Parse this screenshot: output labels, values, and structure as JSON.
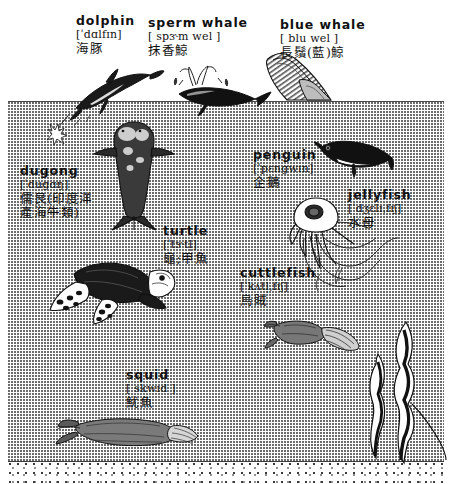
{
  "page": {
    "background_color": "#ffffff",
    "ink_color": "#111111",
    "water_fill": "stippled-halftone",
    "seabed": "speckled-sand-strip"
  },
  "scene": {
    "waterline_label": "water-surface-line",
    "regions": [
      {
        "name": "sky-above-water"
      },
      {
        "name": "underwater-body"
      },
      {
        "name": "sea-floor"
      }
    ]
  },
  "entries": [
    {
      "id": "dolphin",
      "word": "dolphin",
      "ipa": "[ˈdɑlfɪn]",
      "chinese": "海豚",
      "chinese2": "",
      "figure": "dolphin-leaping-figure"
    },
    {
      "id": "sperm-whale",
      "word": "sperm whale",
      "ipa": "[ spɝm wel ]",
      "chinese": "抹香鯨",
      "chinese2": "",
      "figure": "sperm-whale-figure"
    },
    {
      "id": "blue-whale",
      "word": "blue whale",
      "ipa": "[ blu wel ]",
      "chinese": "長鬚(藍)鯨",
      "chinese2": "",
      "figure": "blue-whale-figure"
    },
    {
      "id": "dugong",
      "word": "dugong",
      "ipa": "[ˈdugɑŋ]",
      "chinese": "儒艮(印度洋",
      "chinese2": "產海牛類)",
      "figure": "dugong-figure"
    },
    {
      "id": "penguin",
      "word": "penguin",
      "ipa": "[ˈpɛngwɪn]",
      "chinese": "企鵝",
      "chinese2": "",
      "figure": "penguin-figure"
    },
    {
      "id": "jellyfish",
      "word": "jellyfish",
      "ipa": "[ˈdʒɛlɪˌfɪʃ]",
      "chinese": "水母",
      "chinese2": "",
      "figure": "jellyfish-figure"
    },
    {
      "id": "turtle",
      "word": "turtle",
      "ipa": "[ˈtɝtl̩]",
      "chinese": "龜;甲魚",
      "chinese2": "",
      "figure": "turtle-figure"
    },
    {
      "id": "cuttlefish",
      "word": "cuttlefish",
      "ipa": "[ˈkʌtl̩ˌfɪʃ]",
      "chinese": "烏賊",
      "chinese2": "",
      "figure": "cuttlefish-figure"
    },
    {
      "id": "squid",
      "word": "squid",
      "ipa": "[ skwɪd ]",
      "chinese": "魷魚",
      "chinese2": "",
      "figure": "squid-figure"
    }
  ],
  "decorations": [
    {
      "id": "seaweed",
      "name": "kelp-seaweed-figure"
    },
    {
      "id": "splash",
      "name": "water-splash-figure"
    },
    {
      "id": "blowhole-spray",
      "name": "whale-spout-figure"
    }
  ]
}
